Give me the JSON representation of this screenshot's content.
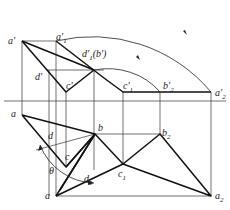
{
  "diagram": {
    "type": "descriptive-geometry-projection",
    "labels": {
      "a_prime": "a'",
      "a1_prime": "a'",
      "a1_prime_sub": "1",
      "d1_prime_b_prime": "d'",
      "d1_prime_sub": "1",
      "b_prime_paren": "(b')",
      "d_prime": "d'",
      "c_prime": "c'",
      "c1_prime": "c'",
      "c1_prime_sub": "1",
      "b2_prime": "b'",
      "b2_prime_sub": "2",
      "a2_prime": "a'",
      "a2_prime_sub": "2",
      "a_top": "a",
      "b": "b",
      "d": "d",
      "c": "c",
      "theta": "θ",
      "d1": "d",
      "d1_sub": "1",
      "c1": "c",
      "c1_sub": "1",
      "b2": "b",
      "b2_sub": "2",
      "a_bottom": "a",
      "a2": "a",
      "a2_sub": "2"
    },
    "points": {
      "a_prime": [
        22,
        41
      ],
      "a1_prime": [
        56,
        41
      ],
      "d1_prime_b_prime": [
        94,
        70
      ],
      "c_prime": [
        66,
        92
      ],
      "c1_prime": [
        123,
        92
      ],
      "b2_prime": [
        160,
        92
      ],
      "a2_prime": [
        211,
        92
      ],
      "a_top": [
        22,
        115
      ],
      "b": [
        95,
        134
      ],
      "c": [
        66,
        167
      ],
      "a_bottom": [
        56,
        196
      ],
      "c1": [
        123,
        164
      ],
      "b2": [
        160,
        134
      ],
      "a2": [
        211,
        196
      ]
    },
    "projection_axis_y": 101
  }
}
